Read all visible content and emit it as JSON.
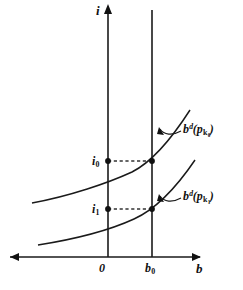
{
  "figure": {
    "kind": "economics-diagram",
    "background_color": "#ffffff",
    "ink_color": "#1a1a1a",
    "width": 243,
    "height": 290
  },
  "axes": {
    "vertical": {
      "label": "i",
      "name": "interest-rate-axis",
      "x": 108,
      "top_y": 5,
      "bottom_y": 257,
      "arrow": "up"
    },
    "horizontal": {
      "label": "b",
      "name": "bond-quantity-axis",
      "y": 257,
      "left_x": 10,
      "right_x": 200,
      "arrow": "both"
    },
    "origin_label": "0"
  },
  "reference_line": {
    "label": "b",
    "sub": "0",
    "x": 152,
    "top_y": 10,
    "bottom_y": 257
  },
  "value_markers": [
    {
      "name": "i0-marker",
      "label": "i",
      "sub": "0",
      "y": 161,
      "from_x": 108,
      "to_x": 152
    },
    {
      "name": "i1-marker",
      "label": "i",
      "sub": "1",
      "y": 209,
      "from_x": 108,
      "to_x": 152
    }
  ],
  "curves": [
    {
      "name": "bond-demand-curve-upper",
      "base": "b",
      "superscript": "d",
      "arg_open": "(",
      "arg_base": "p",
      "arg_sub": "k",
      "arg_sub_sub": "0",
      "arg_close": ")",
      "label_text": "bd(pk0)",
      "label_x": 183,
      "label_y": 123,
      "path": "M 32,203 C 70,196 108,183 132,172 C 152,162 172,138 190,110"
    },
    {
      "name": "bond-demand-curve-lower",
      "base": "b",
      "superscript": "d",
      "arg_open": "(",
      "arg_base": "p",
      "arg_sub": "k",
      "arg_sub_sub": "1",
      "arg_close": ")",
      "label_text": "bd(pk1)",
      "label_x": 183,
      "label_y": 190,
      "path": "M 38,245 C 76,239 110,230 134,219 C 154,210 176,188 195,160"
    }
  ],
  "leaders": [
    {
      "name": "leader-upper",
      "path": "M 181,131 C 172,136 164,135 160,129"
    },
    {
      "name": "leader-lower",
      "path": "M 181,198 C 172,203 164,202 160,196"
    }
  ]
}
